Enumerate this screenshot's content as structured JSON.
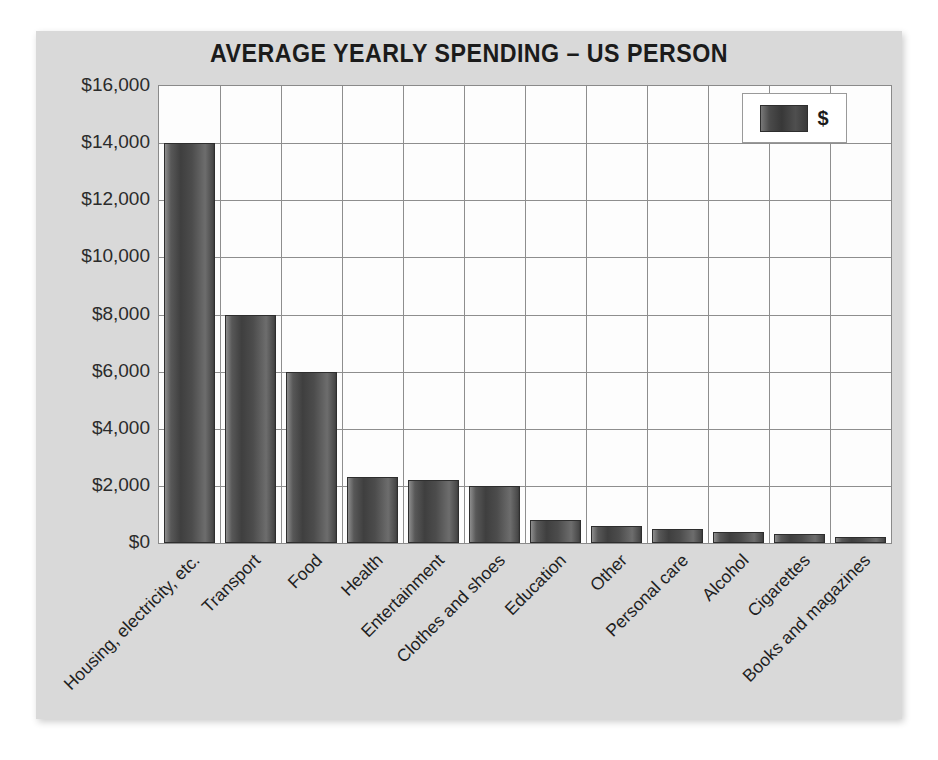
{
  "chart_data": {
    "type": "bar",
    "title": "AVERAGE YEARLY SPENDING – US PERSON",
    "xlabel": "",
    "ylabel": "",
    "ylim": [
      0,
      16000
    ],
    "ytick_step": 2000,
    "ytick_labels": [
      "$16,000",
      "$14,000",
      "$12,000",
      "$10,000",
      "$8,000",
      "$6,000",
      "$4,000",
      "$2,000",
      "$0"
    ],
    "ytick_values": [
      16000,
      14000,
      12000,
      10000,
      8000,
      6000,
      4000,
      2000,
      0
    ],
    "grid": true,
    "legend_position": "top-right",
    "legend_entries": [
      "$"
    ],
    "categories": [
      "Housing, electricity, etc.",
      "Transport",
      "Food",
      "Health",
      "Entertainment",
      "Clothes and shoes",
      "Education",
      "Other",
      "Personal care",
      "Alcohol",
      "Cigarettes",
      "Books and magazines"
    ],
    "series": [
      {
        "name": "$",
        "values": [
          14000,
          8000,
          6000,
          2300,
          2200,
          2000,
          800,
          600,
          500,
          400,
          300,
          200
        ]
      }
    ]
  },
  "legend": {
    "label": "$",
    "swatch_color": "#454545"
  },
  "style": {
    "panel_background": "#d9d9d9",
    "plot_background": "#fdfdfd",
    "grid_color": "#8e8e8e",
    "bar_color": "#4a4a4a",
    "text_color": "#1f1f1f"
  }
}
